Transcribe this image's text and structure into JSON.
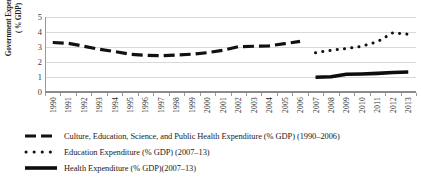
{
  "chart_data": {
    "type": "line",
    "title": "",
    "xlabel": "",
    "ylabel": "Government Expenditure ( % GDP)",
    "ylabel_line1": "Government Expenditure",
    "ylabel_line2": "( % GDP)",
    "ylim": [
      0,
      5
    ],
    "yticks": [
      0,
      1,
      2,
      3,
      4,
      5
    ],
    "grid": true,
    "legend_position": "bottom-left",
    "categories": [
      "1990",
      "1991",
      "1992",
      "1993",
      "1994",
      "1995",
      "1996",
      "1997",
      "1998",
      "1999",
      "2000",
      "2001",
      "2002",
      "2003",
      "2004",
      "2005",
      "2006",
      "2007",
      "2008",
      "2009",
      "2010",
      "2011",
      "2012",
      "2013"
    ],
    "series": [
      {
        "name": "Culture, Education, Science, and Public Health Expenditure (% GDP) (1990–2006)",
        "style": "dashed",
        "color": "#111111",
        "x": [
          "1990",
          "1991",
          "1992",
          "1993",
          "1994",
          "1995",
          "1996",
          "1997",
          "1998",
          "1999",
          "2000",
          "2001",
          "2002",
          "2003",
          "2004",
          "2005",
          "2006"
        ],
        "values": [
          3.3,
          3.25,
          3.05,
          2.85,
          2.7,
          2.52,
          2.45,
          2.42,
          2.47,
          2.52,
          2.62,
          2.78,
          3.02,
          3.05,
          3.08,
          3.22,
          3.38
        ]
      },
      {
        "name": "Education Expenditure (% GDP) (2007–13)",
        "style": "dotted",
        "color": "#111111",
        "x": [
          "2007",
          "2008",
          "2009",
          "2010",
          "2011",
          "2012",
          "2013"
        ],
        "values": [
          2.62,
          2.78,
          2.9,
          3.05,
          3.35,
          3.95,
          3.85
        ]
      },
      {
        "name": "Health Expenditure (% GDP)(2007–13)",
        "style": "solid",
        "color": "#0d0d0d",
        "x": [
          "2007",
          "2008",
          "2009",
          "2010",
          "2011",
          "2012",
          "2013"
        ],
        "values": [
          0.98,
          1.02,
          1.18,
          1.2,
          1.24,
          1.3,
          1.33
        ]
      }
    ]
  },
  "legend": {
    "items": [
      {
        "label": "Culture, Education, Science, and Public Health Expenditure (% GDP) (1990–2006)",
        "marker": "dashed-line-marker"
      },
      {
        "label": "Education Expenditure (% GDP) (2007–13)",
        "marker": "dotted-line-marker"
      },
      {
        "label": "Health Expenditure (% GDP)(2007–13)",
        "marker": "solid-line-marker"
      }
    ]
  }
}
